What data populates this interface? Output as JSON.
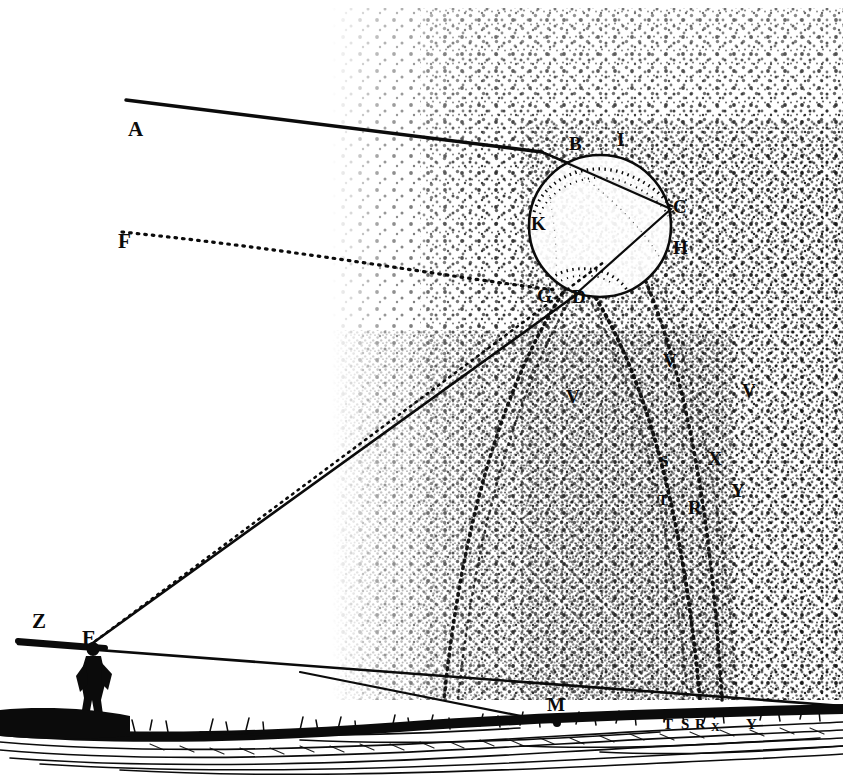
{
  "figure": {
    "colors": {
      "ink": "#0b0b0b",
      "paper": "#ffffff"
    }
  },
  "labels": {
    "sun_ray_source": "A",
    "secondary_ray_source": "F",
    "drop_entry_top": "B",
    "drop_entry_top_alt": "I",
    "drop_right": "C",
    "drop_right_lower": "H",
    "drop_inner_left": "K",
    "drop_bottom_left": "G",
    "drop_bottom": "D",
    "observer_eye": "E",
    "zenith_marker": "Z",
    "ground_point_m": "M",
    "arc_v_left": "V",
    "arc_v_mid": "V",
    "arc_v_right": "V",
    "arc_s": "S",
    "arc_t": "T",
    "arc_x": "X",
    "arc_r": "R",
    "arc_y": "Y",
    "ground_t": "T",
    "ground_s": "S",
    "ground_r": "R",
    "ground_v": "V",
    "ground_x": "X",
    "ground_y": "Y"
  },
  "label_positions": {
    "A": {
      "x": 128,
      "y": 136
    },
    "F": {
      "x": 118,
      "y": 248
    },
    "B": {
      "x": 575,
      "y": 150
    },
    "I": {
      "x": 620,
      "y": 146
    },
    "C": {
      "x": 676,
      "y": 212
    },
    "H": {
      "x": 678,
      "y": 253
    },
    "K": {
      "x": 537,
      "y": 228
    },
    "G": {
      "x": 543,
      "y": 300
    },
    "D": {
      "x": 576,
      "y": 302
    },
    "E": {
      "x": 84,
      "y": 643
    },
    "Z": {
      "x": 40,
      "y": 626
    },
    "M": {
      "x": 553,
      "y": 709
    },
    "V_left": {
      "x": 573,
      "y": 402
    },
    "V_mid": {
      "x": 669,
      "y": 366
    },
    "V_right": {
      "x": 748,
      "y": 396
    },
    "S": {
      "x": 665,
      "y": 464
    },
    "T": {
      "x": 663,
      "y": 503
    },
    "X": {
      "x": 714,
      "y": 463
    },
    "R": {
      "x": 694,
      "y": 512
    },
    "Y": {
      "x": 737,
      "y": 495
    },
    "g_T": {
      "x": 668,
      "y": 726
    },
    "g_S": {
      "x": 686,
      "y": 726
    },
    "g_R": {
      "x": 701,
      "y": 726
    },
    "g_V": {
      "x": 714,
      "y": 716
    },
    "g_X": {
      "x": 716,
      "y": 729
    },
    "g_Y": {
      "x": 751,
      "y": 726
    }
  },
  "geometry": {
    "droplet": {
      "cx": 600,
      "cy": 226,
      "r": 71
    },
    "rain_field": {
      "x": 332,
      "y": 8,
      "width": 511,
      "height": 718
    },
    "horizon_left": {
      "x": 18,
      "y": 644
    },
    "horizon_right": {
      "x": 843,
      "y": 705
    },
    "ground_top": 700,
    "ground_bottom": 760
  },
  "caption": ""
}
